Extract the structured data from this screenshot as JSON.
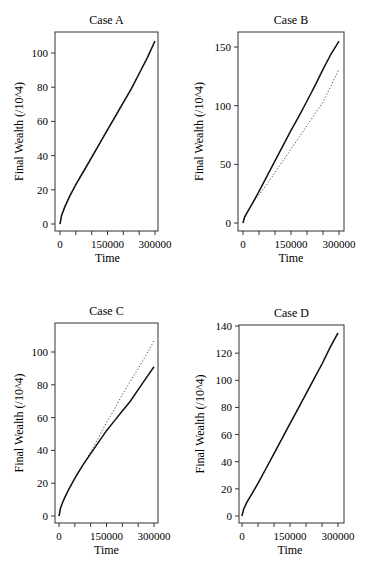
{
  "chart_data": [
    {
      "type": "line",
      "title": "Case A",
      "xlabel": "Time",
      "ylabel": "Final Wealth (/10^4)",
      "xlim": [
        0,
        300000
      ],
      "ylim": [
        -3,
        112
      ],
      "xticks": [
        0,
        50000,
        100000,
        150000,
        200000,
        250000,
        300000
      ],
      "xtick_labels": [
        "0",
        "",
        "",
        "150000",
        "",
        "",
        "300000"
      ],
      "yticks": [
        0,
        20,
        40,
        60,
        80,
        100
      ],
      "ytick_labels": [
        "0",
        "20",
        "40",
        "60",
        "80",
        "100"
      ],
      "grid": false,
      "x": [
        0,
        5000,
        15000,
        30000,
        50000,
        75000,
        100000,
        125000,
        150000,
        175000,
        200000,
        225000,
        250000,
        275000,
        300000
      ],
      "series": [
        {
          "name": "solid",
          "style": "solid",
          "values": [
            0,
            5,
            10,
            16,
            23,
            31,
            39,
            47,
            55,
            63,
            71,
            79,
            88,
            97,
            107
          ]
        },
        {
          "name": "dotted",
          "style": "dotted",
          "values": [
            0,
            5,
            10,
            16,
            23,
            31.5,
            39.5,
            47.5,
            55.5,
            63.5,
            71.5,
            79.5,
            88,
            97,
            107
          ]
        }
      ]
    },
    {
      "type": "line",
      "title": "Case B",
      "xlabel": "Time",
      "ylabel": "Final Wealth (/10^4)",
      "xlim": [
        0,
        300000
      ],
      "ylim": [
        -5,
        163
      ],
      "xticks": [
        0,
        50000,
        100000,
        150000,
        200000,
        250000,
        300000
      ],
      "xtick_labels": [
        "0",
        "",
        "",
        "150000",
        "",
        "",
        "300000"
      ],
      "yticks": [
        0,
        50,
        100,
        150
      ],
      "ytick_labels": [
        "0",
        "50",
        "100",
        "150"
      ],
      "grid": false,
      "x": [
        0,
        5000,
        15000,
        30000,
        50000,
        75000,
        100000,
        125000,
        150000,
        175000,
        200000,
        225000,
        250000,
        275000,
        300000
      ],
      "series": [
        {
          "name": "solid",
          "style": "solid",
          "values": [
            0,
            5,
            10,
            17,
            27,
            40,
            53,
            66,
            79,
            91,
            104,
            117,
            131,
            144,
            155
          ]
        },
        {
          "name": "dotted",
          "style": "dotted",
          "values": [
            0,
            5,
            10,
            17,
            24,
            33,
            43,
            53,
            63,
            73,
            83,
            93,
            103,
            117,
            131
          ]
        }
      ]
    },
    {
      "type": "line",
      "title": "Case C",
      "xlabel": "Time",
      "ylabel": "Final Wealth (/10^4)",
      "xlim": [
        0,
        300000
      ],
      "ylim": [
        -3,
        115
      ],
      "xticks": [
        0,
        50000,
        100000,
        150000,
        200000,
        250000,
        300000
      ],
      "xtick_labels": [
        "0",
        "",
        "",
        "150000",
        "",
        "",
        "300000"
      ],
      "yticks": [
        0,
        20,
        40,
        60,
        80,
        100
      ],
      "ytick_labels": [
        "0",
        "20",
        "40",
        "60",
        "80",
        "100"
      ],
      "grid": false,
      "x": [
        0,
        5000,
        15000,
        30000,
        50000,
        75000,
        100000,
        125000,
        150000,
        175000,
        200000,
        225000,
        250000,
        275000,
        300000
      ],
      "series": [
        {
          "name": "solid",
          "style": "solid",
          "values": [
            0,
            5,
            10,
            16,
            23,
            31,
            38,
            45,
            52,
            58,
            64,
            70,
            77,
            84,
            91
          ]
        },
        {
          "name": "dotted",
          "style": "dotted",
          "values": [
            0,
            5,
            10,
            16,
            23,
            31,
            39,
            48,
            57,
            65,
            74,
            82,
            90,
            98,
            107
          ]
        }
      ]
    },
    {
      "type": "line",
      "title": "Case D",
      "xlabel": "Time",
      "ylabel": "Final Wealth (/10^4)",
      "xlim": [
        0,
        300000
      ],
      "ylim": [
        -4,
        140
      ],
      "xticks": [
        0,
        50000,
        100000,
        150000,
        200000,
        250000,
        300000
      ],
      "xtick_labels": [
        "0",
        "",
        "",
        "150000",
        "",
        "",
        "300000"
      ],
      "yticks": [
        0,
        20,
        40,
        60,
        80,
        100,
        120,
        140
      ],
      "ytick_labels": [
        "0",
        "20",
        "40",
        "60",
        "80",
        "100",
        "120",
        "140"
      ],
      "grid": false,
      "x": [
        0,
        5000,
        15000,
        30000,
        50000,
        75000,
        100000,
        125000,
        150000,
        175000,
        200000,
        225000,
        250000,
        275000,
        300000
      ],
      "series": [
        {
          "name": "solid",
          "style": "solid",
          "values": [
            0,
            5,
            10,
            16,
            24,
            35,
            46,
            57,
            68,
            79,
            90,
            101,
            112,
            124,
            135
          ]
        },
        {
          "name": "dotted",
          "style": "dotted",
          "values": [
            0,
            5,
            10,
            16,
            24,
            35,
            46,
            57,
            68,
            79,
            90,
            101,
            112,
            124,
            135
          ]
        }
      ]
    }
  ],
  "panels": [
    {
      "title": "Case A",
      "xlabel": "Time",
      "ylabel": "Final Wealth (/10^4)"
    },
    {
      "title": "Case B",
      "xlabel": "Time",
      "ylabel": "Final Wealth (/10^4)"
    },
    {
      "title": "Case C",
      "xlabel": "Time",
      "ylabel": "Final Wealth (/10^4)"
    },
    {
      "title": "Case D",
      "xlabel": "Time",
      "ylabel": "Final Wealth (/10^4)"
    }
  ],
  "colors": {
    "line": "#111111",
    "axis": "#333333",
    "background": "#ffffff"
  }
}
